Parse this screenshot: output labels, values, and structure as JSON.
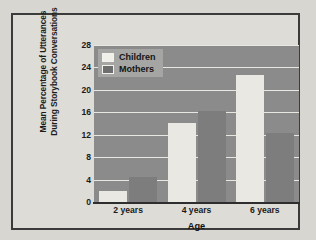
{
  "figure": {
    "frame_color": "#3b3b3b",
    "page_background": "#d8d6d1"
  },
  "chart_data": {
    "type": "bar",
    "title": "",
    "subtitle": "",
    "xlabel": "Age",
    "ylabel": "Mean Percentage of Utterances During Storybook Conversations",
    "ylabel_lines": [
      "Mean Percentage of Utterances",
      "During Storybook Conversations"
    ],
    "categories": [
      "2 years",
      "4 years",
      "6 years"
    ],
    "series": [
      {
        "name": "Children",
        "color": "#e9e8e3",
        "values": [
          2.0,
          14.1,
          22.7
        ]
      },
      {
        "name": "Mothers",
        "color": "#7d7d7d",
        "values": [
          4.5,
          16.3,
          12.3
        ]
      }
    ],
    "ylim": [
      0,
      28
    ],
    "yticks": [
      0,
      4,
      8,
      12,
      16,
      20,
      24,
      28
    ],
    "ytick_labels": [
      "0",
      "4",
      "8",
      "12",
      "16",
      "20",
      "24",
      "28"
    ],
    "grid": true,
    "grid_color": "#e8e7e2",
    "plot_background": "#8b8b8b",
    "legend_position": "top-left",
    "legend": [
      {
        "label": "Children",
        "swatch": "#f0efea"
      },
      {
        "label": "Mothers",
        "swatch": "#6e6e6e"
      }
    ]
  }
}
